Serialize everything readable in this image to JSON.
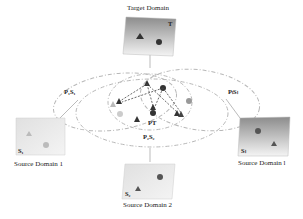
{
  "diagram": {
    "target": {
      "title": "Target Domain",
      "symbol": "T"
    },
    "sources": [
      {
        "title": "Source Domain 1",
        "symbol": "S₁"
      },
      {
        "title": "Source Domain 2",
        "symbol": "S₂"
      },
      {
        "title": "Source Domain l",
        "symbol": "Sₗ"
      }
    ],
    "projections": [
      {
        "label": "P₁S₁"
      },
      {
        "label": "P₂S₂"
      },
      {
        "label": "PₗSₗ"
      }
    ],
    "center_label": "PT",
    "colors": {
      "box_top": "#8c8c8c",
      "box_bottom": "#f2f2f2",
      "ellipse": "#b8b8b8",
      "marker_dark": "#444444",
      "marker_light": "#bdbdbd"
    }
  }
}
